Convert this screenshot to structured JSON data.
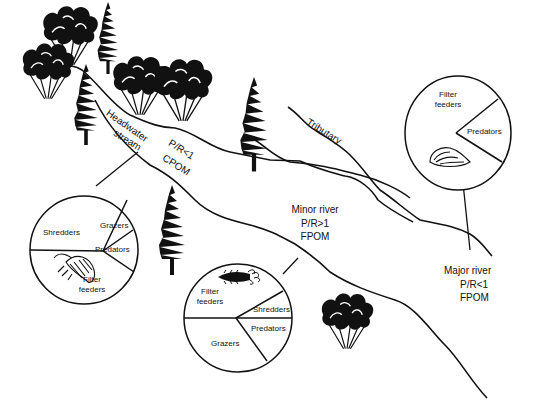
{
  "diagram": {
    "stages": [
      {
        "name": "Headwater stream",
        "label_line1": "Headwater",
        "label_line2": "stream",
        "pr_ratio": "P/R<1",
        "organic_matter": "CPOM",
        "pie": {
          "slices": [
            {
              "label": "Shredders",
              "share": 0.42
            },
            {
              "label": "Grazers",
              "share": 0.12
            },
            {
              "label": "Predators",
              "share": 0.13
            },
            {
              "label": "Filter feeders",
              "label_line1": "Filter",
              "label_line2": "feeders",
              "share": 0.33
            }
          ],
          "organism_icon": "isopod-icon"
        }
      },
      {
        "name": "Tributary",
        "label": "Tributary"
      },
      {
        "name": "Minor river",
        "label": "Minor river",
        "pr_ratio": "P/R>1",
        "organic_matter": "FPOM",
        "pie": {
          "slices": [
            {
              "label": "Filter feeders",
              "label_line1": "Filter",
              "label_line2": "feeders",
              "share": 0.43
            },
            {
              "label": "Shredders",
              "share": 0.07
            },
            {
              "label": "Predators",
              "share": 0.17
            },
            {
              "label": "Grazers",
              "share": 0.33
            }
          ],
          "organism_icon": "insect-larva-icon"
        }
      },
      {
        "name": "Major river",
        "label": "Major river",
        "pr_ratio": "P/R<1",
        "organic_matter": "FPOM",
        "pie": {
          "slices": [
            {
              "label": "Filter feeders",
              "label_line1": "Filter",
              "label_line2": "feeders",
              "share": 0.82
            },
            {
              "label": "Predators",
              "share": 0.18
            }
          ],
          "organism_icon": "clam-icon"
        }
      }
    ]
  }
}
